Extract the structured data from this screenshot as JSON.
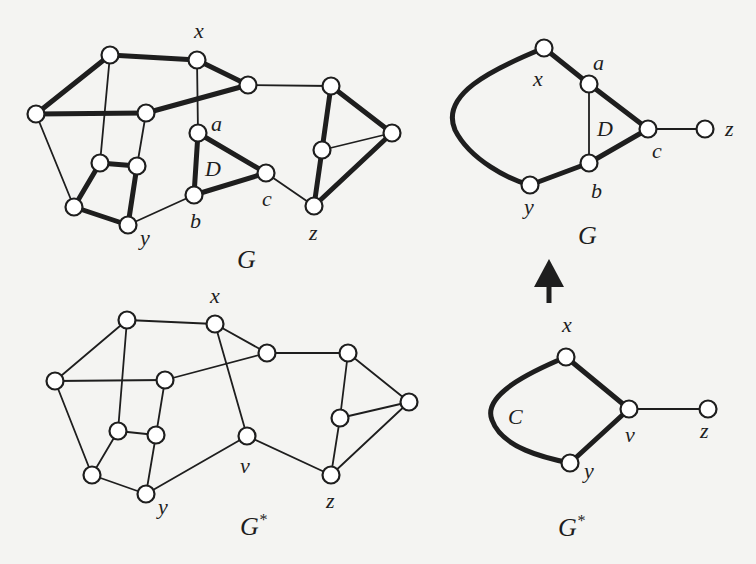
{
  "figure": {
    "panels": [
      {
        "id": "G_left",
        "caption": "G",
        "caption_pos": [
          237,
          268
        ],
        "nodes": [
          {
            "id": "n1",
            "x": 110,
            "y": 55
          },
          {
            "id": "x",
            "x": 197,
            "y": 60,
            "label": "x",
            "lx": 194,
            "ly": 38
          },
          {
            "id": "n3",
            "x": 248,
            "y": 85
          },
          {
            "id": "n4",
            "x": 36,
            "y": 114
          },
          {
            "id": "n5",
            "x": 146,
            "y": 113
          },
          {
            "id": "a",
            "x": 198,
            "y": 133,
            "label": "a",
            "lx": 211,
            "ly": 131
          },
          {
            "id": "n7",
            "x": 100,
            "y": 163
          },
          {
            "id": "n8",
            "x": 137,
            "y": 166
          },
          {
            "id": "c",
            "x": 266,
            "y": 173,
            "label": "c",
            "lx": 262,
            "ly": 206
          },
          {
            "id": "b",
            "x": 194,
            "y": 195,
            "label": "b",
            "lx": 190,
            "ly": 228
          },
          {
            "id": "n9",
            "x": 74,
            "y": 207
          },
          {
            "id": "y",
            "x": 128,
            "y": 225,
            "label": "y",
            "lx": 140,
            "ly": 245
          },
          {
            "id": "n10",
            "x": 331,
            "y": 86
          },
          {
            "id": "n11",
            "x": 322,
            "y": 150
          },
          {
            "id": "n12",
            "x": 392,
            "y": 133
          },
          {
            "id": "z",
            "x": 314,
            "y": 206,
            "label": "z",
            "lx": 309,
            "ly": 240
          }
        ],
        "edges": [
          [
            "n1",
            "x",
            "thick"
          ],
          [
            "x",
            "n3",
            "thick"
          ],
          [
            "n1",
            "n4",
            "thick"
          ],
          [
            "n4",
            "n5",
            "thick"
          ],
          [
            "n5",
            "n3",
            "thick"
          ],
          [
            "n1",
            "n7",
            "thin"
          ],
          [
            "x",
            "a",
            "thin"
          ],
          [
            "n4",
            "n9",
            "thin"
          ],
          [
            "n5",
            "n8",
            "thin"
          ],
          [
            "n7",
            "n8",
            "thick"
          ],
          [
            "n7",
            "n9",
            "thick"
          ],
          [
            "n8",
            "y",
            "thick"
          ],
          [
            "n9",
            "y",
            "thick"
          ],
          [
            "y",
            "b",
            "thin"
          ],
          [
            "a",
            "b",
            "thick"
          ],
          [
            "a",
            "c",
            "thick"
          ],
          [
            "b",
            "c",
            "thick"
          ],
          [
            "c",
            "z",
            "thin"
          ],
          [
            "n3",
            "n10",
            "thin"
          ],
          [
            "n10",
            "n11",
            "thick"
          ],
          [
            "n10",
            "n12",
            "thick"
          ],
          [
            "n11",
            "n12",
            "thin"
          ],
          [
            "n11",
            "z",
            "thick"
          ],
          [
            "z",
            "n12",
            "thick"
          ]
        ],
        "face_labels": [
          {
            "text": "D",
            "x": 205,
            "y": 176
          }
        ]
      },
      {
        "id": "G_right",
        "caption": "G",
        "caption_pos": [
          578,
          244
        ],
        "nodes": [
          {
            "id": "x",
            "x": 544,
            "y": 48,
            "label": "x",
            "lx": 533,
            "ly": 86
          },
          {
            "id": "a",
            "x": 589,
            "y": 84,
            "label": "a",
            "lx": 593,
            "ly": 70
          },
          {
            "id": "c",
            "x": 648,
            "y": 129,
            "label": "c",
            "lx": 652,
            "ly": 158
          },
          {
            "id": "z",
            "x": 705,
            "y": 129,
            "label": "z",
            "lx": 725,
            "ly": 136
          },
          {
            "id": "b",
            "x": 589,
            "y": 163,
            "label": "b",
            "lx": 591,
            "ly": 198
          },
          {
            "id": "y",
            "x": 530,
            "y": 185,
            "label": "y",
            "lx": 524,
            "ly": 214
          }
        ],
        "edges": [
          [
            "x",
            "a",
            "thick"
          ],
          [
            "a",
            "c",
            "thick"
          ],
          [
            "a",
            "b",
            "thin"
          ],
          [
            "b",
            "c",
            "thick"
          ],
          [
            "y",
            "b",
            "thick"
          ],
          [
            "c",
            "z",
            "thin"
          ]
        ],
        "curves": [
          {
            "d": "M544,48 C490,70 440,95 455,130 C470,160 510,180 530,185",
            "style": "thick"
          }
        ],
        "face_labels": [
          {
            "text": "D",
            "x": 597,
            "y": 136
          }
        ]
      },
      {
        "id": "Gstar_left",
        "caption": "G*",
        "caption_pos": [
          240,
          535
        ],
        "nodes": [
          {
            "id": "n1",
            "x": 127,
            "y": 320
          },
          {
            "id": "x",
            "x": 215,
            "y": 324,
            "label": "x",
            "lx": 210,
            "ly": 303
          },
          {
            "id": "n3",
            "x": 267,
            "y": 353
          },
          {
            "id": "n4",
            "x": 55,
            "y": 381
          },
          {
            "id": "n5",
            "x": 165,
            "y": 380
          },
          {
            "id": "n7",
            "x": 118,
            "y": 431
          },
          {
            "id": "n8",
            "x": 156,
            "y": 435
          },
          {
            "id": "v",
            "x": 247,
            "y": 436,
            "label": "v",
            "lx": 240,
            "ly": 473
          },
          {
            "id": "n9",
            "x": 92,
            "y": 475
          },
          {
            "id": "y",
            "x": 146,
            "y": 494,
            "label": "y",
            "lx": 158,
            "ly": 514
          },
          {
            "id": "n10",
            "x": 348,
            "y": 353
          },
          {
            "id": "n11",
            "x": 340,
            "y": 418
          },
          {
            "id": "n12",
            "x": 409,
            "y": 402
          },
          {
            "id": "z",
            "x": 331,
            "y": 475,
            "label": "z",
            "lx": 326,
            "ly": 508
          }
        ],
        "edges": [
          [
            "n1",
            "x",
            "thin"
          ],
          [
            "x",
            "n3",
            "thin"
          ],
          [
            "n1",
            "n4",
            "thin"
          ],
          [
            "n4",
            "n5",
            "thin"
          ],
          [
            "n5",
            "n3",
            "thin"
          ],
          [
            "n1",
            "n7",
            "thin"
          ],
          [
            "x",
            "v",
            "thin"
          ],
          [
            "n4",
            "n9",
            "thin"
          ],
          [
            "n5",
            "n8",
            "thin"
          ],
          [
            "n7",
            "n8",
            "thin"
          ],
          [
            "n7",
            "n9",
            "thin"
          ],
          [
            "n8",
            "y",
            "thin"
          ],
          [
            "n9",
            "y",
            "thin"
          ],
          [
            "y",
            "v",
            "thin"
          ],
          [
            "v",
            "z",
            "thin"
          ],
          [
            "n3",
            "n10",
            "thin"
          ],
          [
            "n10",
            "n11",
            "thin"
          ],
          [
            "n10",
            "n12",
            "thin"
          ],
          [
            "n11",
            "n12",
            "thin"
          ],
          [
            "n11",
            "z",
            "thin"
          ],
          [
            "z",
            "n12",
            "thin"
          ]
        ],
        "face_labels": []
      },
      {
        "id": "Gstar_right",
        "caption": "G*",
        "caption_pos": [
          558,
          536
        ],
        "nodes": [
          {
            "id": "x",
            "x": 566,
            "y": 357,
            "label": "x",
            "lx": 562,
            "ly": 332
          },
          {
            "id": "v",
            "x": 629,
            "y": 409,
            "label": "v",
            "lx": 625,
            "ly": 442
          },
          {
            "id": "z",
            "x": 708,
            "y": 409,
            "label": "z",
            "lx": 700,
            "ly": 438
          },
          {
            "id": "y",
            "x": 570,
            "y": 463,
            "label": "y",
            "lx": 584,
            "ly": 478
          }
        ],
        "edges": [
          [
            "x",
            "v",
            "thick"
          ],
          [
            "v",
            "y",
            "thick"
          ],
          [
            "v",
            "z",
            "thin"
          ]
        ],
        "curves": [
          {
            "d": "M566,357 C530,372 482,395 492,420 C502,448 545,458 570,463",
            "style": "thick"
          }
        ],
        "face_labels": [
          {
            "text": "C",
            "x": 508,
            "y": 424
          }
        ]
      }
    ],
    "arrow": {
      "direction": "up",
      "tip": [
        549,
        259
      ],
      "base_y": 287,
      "shaft_end_y": 303,
      "half_width": 15
    },
    "colors": {
      "ink": "#1e1e1e",
      "paper": "#f4f4f2",
      "node_fill": "#ffffff"
    }
  }
}
